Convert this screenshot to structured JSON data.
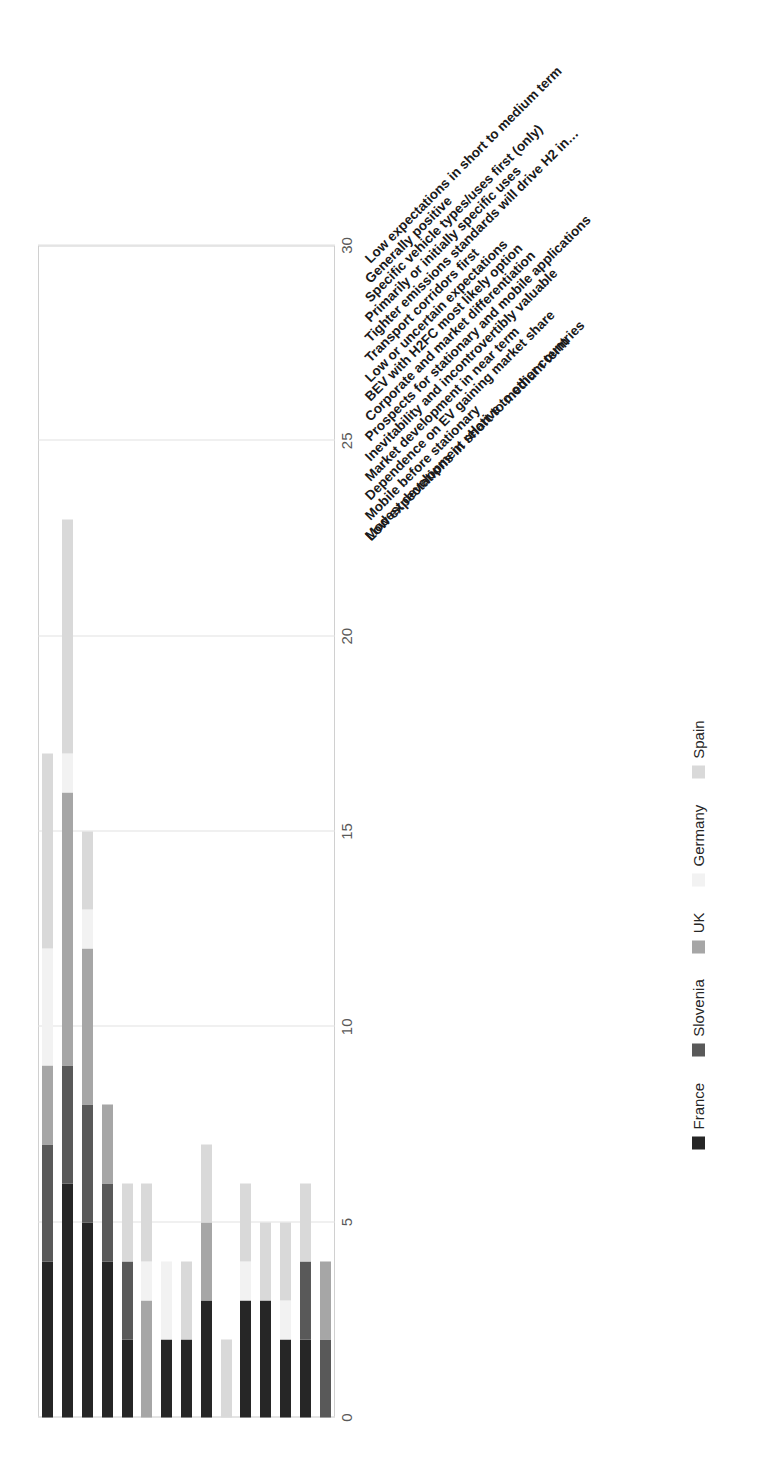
{
  "chart_data": {
    "type": "bar",
    "orientation": "stacked-horizontal",
    "title": "",
    "xlabel": "",
    "ylabel": "",
    "xlim": [
      0,
      30
    ],
    "xticks": [
      "0",
      "5",
      "10",
      "15",
      "20",
      "25",
      "30"
    ],
    "grid": true,
    "legend_position": "bottom",
    "axis_title": "Low expectations in short to medium term",
    "categories": [
      "Low expectations in short to medium term",
      "Generally positive",
      "Specific vehicle types/uses first (only)",
      "Primarily or initially specific uses",
      "Tighter emissions standards will drive H2 in…",
      "Transport corridors first",
      "Low or uncertain expectations",
      "BEV with H2FC most likely option",
      "Corporate and market differentiation",
      "Prospects for stationary and mobile applications",
      "Inevitability and incontrovertibly valuable",
      "Market development in near term",
      "Dependence on EV gaining market share",
      "Mobile before stationary",
      "Modest development relative to other countries"
    ],
    "series": [
      {
        "name": "France",
        "color": "#262626",
        "values": [
          4,
          6,
          5,
          4,
          2,
          0,
          2,
          2,
          3,
          0,
          3,
          3,
          2,
          2,
          0
        ]
      },
      {
        "name": "Slovenia",
        "color": "#595959",
        "values": [
          3,
          3,
          3,
          2,
          2,
          0,
          0,
          0,
          0,
          0,
          0,
          0,
          0,
          2,
          2
        ]
      },
      {
        "name": "UK",
        "color": "#a6a6a6",
        "values": [
          2,
          7,
          4,
          2,
          0,
          3,
          0,
          0,
          2,
          0,
          0,
          0,
          0,
          0,
          2
        ]
      },
      {
        "name": "Germany",
        "color": "#f2f2f2",
        "values": [
          3,
          1,
          1,
          0,
          0,
          1,
          2,
          0,
          0,
          0,
          1,
          0,
          1,
          0,
          0
        ]
      },
      {
        "name": "Spain",
        "color": "#d9d9d9",
        "values": [
          5,
          6,
          2,
          0,
          2,
          2,
          0,
          2,
          2,
          2,
          2,
          2,
          2,
          2,
          0
        ]
      }
    ],
    "totals": [
      17,
      23,
      15,
      8,
      6,
      6,
      4,
      4,
      7,
      2,
      6,
      5,
      5,
      6,
      4
    ]
  },
  "legend": {
    "items": [
      {
        "label": "France",
        "color": "#262626"
      },
      {
        "label": "Slovenia",
        "color": "#595959"
      },
      {
        "label": "UK",
        "color": "#a6a6a6"
      },
      {
        "label": "Germany",
        "color": "#f2f2f2"
      },
      {
        "label": "Spain",
        "color": "#d9d9d9"
      }
    ]
  }
}
